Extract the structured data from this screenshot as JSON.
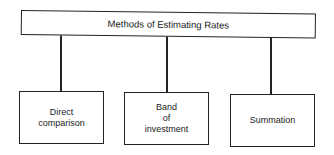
{
  "diagram": {
    "root": {
      "label": "Methods of Estimating Rates"
    },
    "children": [
      {
        "label": "Direct\ncomparison"
      },
      {
        "label": "Band\nof\ninvestment"
      },
      {
        "label": "Summation"
      }
    ],
    "colors": {
      "line": "#222222",
      "background": "#ffffff",
      "text": "#1a1a1a"
    }
  }
}
